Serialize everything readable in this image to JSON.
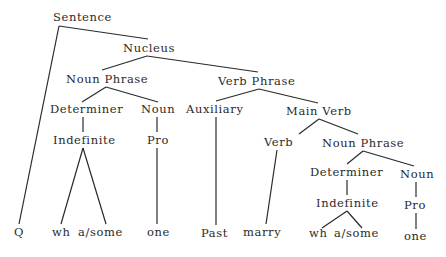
{
  "diagram": {
    "type": "syntax-tree",
    "nodes": [
      {
        "id": "sentence",
        "label": "Sentence"
      },
      {
        "id": "nucleus",
        "label": "Nucleus"
      },
      {
        "id": "np1",
        "label": "Noun Phrase"
      },
      {
        "id": "vp",
        "label": "Verb Phrase"
      },
      {
        "id": "det1",
        "label": "Determiner"
      },
      {
        "id": "noun1",
        "label": "Noun"
      },
      {
        "id": "aux",
        "label": "Auxiliary"
      },
      {
        "id": "mainverb",
        "label": "Main Verb"
      },
      {
        "id": "indef1",
        "label": "Indefinite"
      },
      {
        "id": "pro1",
        "label": "Pro"
      },
      {
        "id": "verb",
        "label": "Verb"
      },
      {
        "id": "np2",
        "label": "Noun Phrase"
      },
      {
        "id": "det2",
        "label": "Determiner"
      },
      {
        "id": "noun2",
        "label": "Noun"
      },
      {
        "id": "indef2",
        "label": "Indefinite"
      },
      {
        "id": "pro2",
        "label": "Pro"
      },
      {
        "id": "q",
        "label": "Q"
      },
      {
        "id": "wh1",
        "label": "wh"
      },
      {
        "id": "asome1",
        "label": "a/some"
      },
      {
        "id": "one1",
        "label": "one"
      },
      {
        "id": "past",
        "label": "Past"
      },
      {
        "id": "marry",
        "label": "marry"
      },
      {
        "id": "wh2",
        "label": "wh"
      },
      {
        "id": "asome2",
        "label": "a/some"
      },
      {
        "id": "one2",
        "label": "one"
      }
    ],
    "edges": [
      [
        "sentence",
        "q"
      ],
      [
        "sentence",
        "nucleus"
      ],
      [
        "nucleus",
        "np1"
      ],
      [
        "nucleus",
        "vp"
      ],
      [
        "np1",
        "det1"
      ],
      [
        "np1",
        "noun1"
      ],
      [
        "det1",
        "indef1"
      ],
      [
        "indef1",
        "wh1"
      ],
      [
        "indef1",
        "asome1"
      ],
      [
        "noun1",
        "pro1"
      ],
      [
        "pro1",
        "one1"
      ],
      [
        "vp",
        "aux"
      ],
      [
        "vp",
        "mainverb"
      ],
      [
        "aux",
        "past"
      ],
      [
        "mainverb",
        "verb"
      ],
      [
        "mainverb",
        "np2"
      ],
      [
        "verb",
        "marry"
      ],
      [
        "np2",
        "det2"
      ],
      [
        "np2",
        "noun2"
      ],
      [
        "det2",
        "indef2"
      ],
      [
        "indef2",
        "wh2"
      ],
      [
        "indef2",
        "asome2"
      ],
      [
        "noun2",
        "pro2"
      ],
      [
        "pro2",
        "one2"
      ]
    ]
  }
}
